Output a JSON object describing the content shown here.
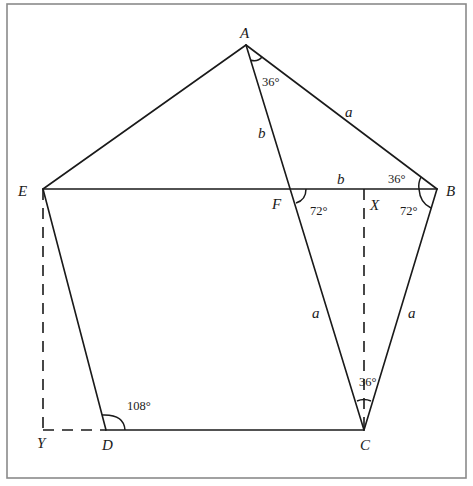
{
  "figure": {
    "type": "regular-pentagon-geometry",
    "frame": {
      "x": 7,
      "y": 4,
      "width": 459,
      "height": 474,
      "color": "#8a8a8a"
    },
    "line_color": "#1a1a1a",
    "points": [
      {
        "id": "A",
        "label": "A",
        "x": 246,
        "y": 45,
        "lx": 240,
        "ly": 38
      },
      {
        "id": "B",
        "label": "B",
        "x": 437,
        "y": 189,
        "lx": 446,
        "ly": 196
      },
      {
        "id": "C",
        "label": "C",
        "x": 364,
        "y": 430,
        "lx": 360,
        "ly": 450
      },
      {
        "id": "D",
        "label": "D",
        "x": 106,
        "y": 430,
        "lx": 102,
        "ly": 450
      },
      {
        "id": "E",
        "label": "E",
        "x": 43,
        "y": 189,
        "lx": 18,
        "ly": 196
      },
      {
        "id": "F",
        "label": "F",
        "x": 292,
        "y": 189,
        "lx": 272,
        "ly": 209
      },
      {
        "id": "X",
        "label": "X",
        "x": 364,
        "y": 189,
        "lx": 370,
        "ly": 210
      },
      {
        "id": "Y",
        "label": "Y",
        "x": 43,
        "y": 430,
        "lx": 37,
        "ly": 448
      }
    ],
    "solid_edges": [
      {
        "from": "A",
        "to": "B"
      },
      {
        "from": "B",
        "to": "C"
      },
      {
        "from": "C",
        "to": "D"
      },
      {
        "from": "D",
        "to": "E"
      },
      {
        "from": "E",
        "to": "A"
      },
      {
        "from": "E",
        "to": "B"
      },
      {
        "from": "A",
        "to": "C"
      }
    ],
    "dashed_edges": [
      {
        "from": "E",
        "to": "Y"
      },
      {
        "from": "Y",
        "to": "D"
      },
      {
        "from": "X",
        "to": "C"
      }
    ],
    "side_labels": [
      {
        "text": "a",
        "x": 345,
        "y": 117,
        "note": "side AB"
      },
      {
        "text": "b",
        "x": 258,
        "y": 138,
        "note": "segment AF"
      },
      {
        "text": "b",
        "x": 337,
        "y": 184,
        "note": "segment FB"
      },
      {
        "text": "a",
        "x": 312,
        "y": 318,
        "note": "segment FC"
      },
      {
        "text": "a",
        "x": 408,
        "y": 318,
        "note": "side BC"
      }
    ],
    "angle_labels": [
      {
        "text": "36°",
        "x": 262,
        "y": 86,
        "vertex": "A"
      },
      {
        "text": "36°",
        "x": 388,
        "y": 183,
        "vertex": "B (ABE)"
      },
      {
        "text": "72°",
        "x": 310,
        "y": 215,
        "vertex": "F"
      },
      {
        "text": "72°",
        "x": 400,
        "y": 215,
        "vertex": "B (EBC)"
      },
      {
        "text": "36°",
        "x": 359,
        "y": 386,
        "vertex": "C"
      },
      {
        "text": "108°",
        "x": 127,
        "y": 410,
        "vertex": "D"
      }
    ]
  }
}
